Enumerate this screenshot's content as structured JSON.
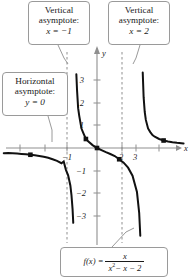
{
  "chart_data": {
    "type": "line",
    "title": "",
    "xlabel": "x",
    "ylabel": "y",
    "xlim": [
      -4.2,
      3.9
    ],
    "ylim": [
      -3.9,
      3.7
    ],
    "xticks": [
      -1,
      2,
      3
    ],
    "yticks": [
      3,
      2,
      1,
      -1,
      -2,
      -3
    ],
    "grid": false,
    "legend": "none",
    "function": "f(x) = x / (x^2 - x - 2)",
    "asymptotes": {
      "vertical": [
        -1,
        2
      ],
      "horizontal": [
        0
      ]
    },
    "series": [
      {
        "name": "left-branch",
        "comment": "x from -4.2 to -1.07; y from ~-0.12 down to -infinity",
        "points": [
          [
            -4.2,
            -0.2333
          ],
          [
            -4.0,
            -0.2222
          ],
          [
            -3.8,
            -0.2344
          ],
          [
            -3.6,
            -0.2483
          ],
          [
            -3.4,
            -0.2642
          ],
          [
            -3.2,
            -0.2824
          ],
          [
            -3.0,
            -0.3
          ],
          [
            -2.8,
            -0.3256
          ],
          [
            -2.6,
            -0.3545
          ],
          [
            -2.4,
            -0.3896
          ],
          [
            -2.2,
            -0.4314
          ],
          [
            -2.0,
            -0.5
          ],
          [
            -1.8,
            -0.5696
          ],
          [
            -1.6,
            -0.678
          ],
          [
            -1.5,
            -0.6
          ],
          [
            -1.4,
            -0.9722
          ],
          [
            -1.3,
            -1.2136
          ],
          [
            -1.2,
            -1.6667
          ],
          [
            -1.15,
            -2.0899
          ],
          [
            -1.1,
            -2.7295
          ],
          [
            -1.07,
            -3.3269
          ]
        ]
      },
      {
        "name": "middle-branch",
        "comment": "x from -0.93 to 1.95; passes through origin; +infinity near x=-1, -infinity near x=2",
        "points": [
          [
            -0.93,
            3.2744
          ],
          [
            -0.9,
            2.5862
          ],
          [
            -0.85,
            1.7722
          ],
          [
            -0.8,
            1.4286
          ],
          [
            -0.7,
            0.8633
          ],
          [
            -0.6,
            0.625
          ],
          [
            -0.5,
            0.4
          ],
          [
            -0.4,
            0.2976
          ],
          [
            -0.2,
            0.1282
          ],
          [
            0.0,
            0.0
          ],
          [
            0.2,
            -0.0926
          ],
          [
            0.4,
            -0.1852
          ],
          [
            0.6,
            -0.2679
          ],
          [
            0.8,
            -0.3571
          ],
          [
            1.0,
            -0.5
          ],
          [
            1.2,
            -0.6522
          ],
          [
            1.4,
            -0.875
          ],
          [
            1.6,
            -1.2308
          ],
          [
            1.8,
            -1.9565
          ],
          [
            1.9,
            -2.8788
          ],
          [
            1.95,
            -3.9
          ]
        ]
      },
      {
        "name": "right-branch",
        "comment": "x from 2.06 to 3.9; +infinity near x=2 decaying toward y=0",
        "points": [
          [
            2.06,
            3.3548
          ],
          [
            2.1,
            2.2581
          ],
          [
            2.15,
            1.6
          ],
          [
            2.2,
            1.25
          ],
          [
            2.3,
            0.8696
          ],
          [
            2.4,
            0.7059
          ],
          [
            2.5,
            0.5714
          ],
          [
            2.6,
            0.5
          ],
          [
            2.8,
            0.4
          ],
          [
            3.0,
            0.3333
          ],
          [
            3.2,
            0.2899
          ],
          [
            3.4,
            0.2576
          ],
          [
            3.6,
            0.2326
          ],
          [
            3.9,
            0.2034
          ]
        ]
      }
    ],
    "marked_points": [
      {
        "x": -3.0,
        "y": -0.3,
        "label": ""
      },
      {
        "x": -0.5,
        "y": 0.4,
        "label": ""
      },
      {
        "x": 0.0,
        "y": 0.0,
        "label": ""
      },
      {
        "x": 1.0,
        "y": -0.5,
        "label": ""
      },
      {
        "x": 3.0,
        "y": 0.3333,
        "label": ""
      }
    ]
  },
  "callouts": {
    "vertical_left": {
      "line1": "Vertical",
      "line2": "asymptote:",
      "line3": "x = −1"
    },
    "vertical_right": {
      "line1": "Vertical",
      "line2": "asymptote:",
      "line3": "x = 2"
    },
    "horizontal": {
      "line1": "Horizontal",
      "line2": "asymptote:",
      "line3": "y = 0"
    },
    "equation": {
      "lhs": "f(x) =",
      "numerator": "x",
      "denominator_base": "x",
      "denominator_exp": "2",
      "denominator_rest": "− x − 2"
    }
  },
  "axes": {
    "x_label": "x",
    "y_label": "y",
    "x_tick_labels": [
      "−1",
      "2",
      "3"
    ],
    "y_tick_labels": [
      "3",
      "2",
      "1",
      "−1",
      "−2",
      "−3"
    ]
  },
  "colors": {
    "curve": "#111111",
    "axis": "#8f8f8f",
    "asymptote": "#8f8f8f",
    "callout_border": "#9a9a9a",
    "text": "#1a1a1a",
    "background": "#ffffff"
  }
}
